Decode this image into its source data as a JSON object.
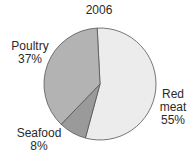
{
  "chart_data": {
    "type": "pie",
    "title": "2006",
    "categories": [
      "Red meat",
      "Seafood",
      "Poultry"
    ],
    "values": [
      55,
      8,
      37
    ],
    "unit": "%",
    "colors": [
      "#ececec",
      "#9a9a9a",
      "#b3b3b3"
    ],
    "labels": [
      {
        "name": "Red meat",
        "line1": "Red",
        "line2": "meat",
        "pct": "55%"
      },
      {
        "name": "Seafood",
        "line1": "Seafood",
        "pct": "8%"
      },
      {
        "name": "Poultry",
        "line1": "Poultry",
        "pct": "37%"
      }
    ],
    "legend": "none",
    "grid": false
  }
}
